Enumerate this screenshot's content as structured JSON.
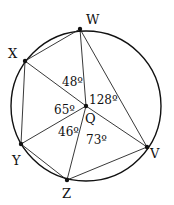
{
  "diagram": {
    "type": "circle-geometry",
    "circle": {
      "cx": 86,
      "cy": 107,
      "r": 76
    },
    "center": {
      "label": "Q",
      "x": 86,
      "y": 106
    },
    "points": [
      {
        "label": "W",
        "x": 80,
        "y": 29
      },
      {
        "label": "X",
        "x": 25,
        "y": 61
      },
      {
        "label": "Y",
        "x": 21,
        "y": 144
      },
      {
        "label": "Z",
        "x": 67,
        "y": 180
      },
      {
        "label": "V",
        "x": 147,
        "y": 147
      }
    ],
    "angles": [
      {
        "label": "48º",
        "between": "XQW"
      },
      {
        "label": "128º",
        "between": "WQV"
      },
      {
        "label": "65º",
        "between": "XQY"
      },
      {
        "label": "46º",
        "between": "YQZ"
      },
      {
        "label": "73º",
        "between": "ZQV"
      }
    ],
    "labels": {
      "W": "W",
      "X": "X",
      "Y": "Y",
      "Z": "Z",
      "V": "V",
      "Q": "Q",
      "a48": "48º",
      "a128": "128º",
      "a65": "65º",
      "a46": "46º",
      "a73": "73º"
    }
  }
}
